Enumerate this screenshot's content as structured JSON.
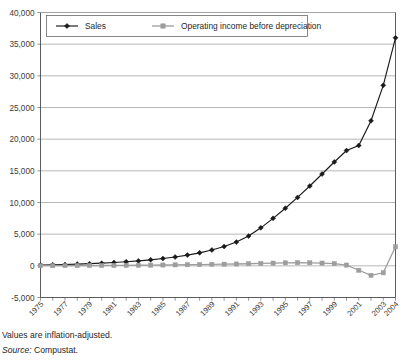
{
  "chart_data": {
    "type": "line",
    "title": "",
    "xlabel": "",
    "ylabel": "",
    "ylim": [
      -5000,
      40000
    ],
    "ytick_step": 5000,
    "ytick_labels": [
      "40,000",
      "35,000",
      "30,000",
      "25,000",
      "20,000",
      "15,000",
      "10,000",
      "5,000",
      "0",
      "-5,000"
    ],
    "ytick_values": [
      40000,
      35000,
      30000,
      25000,
      20000,
      15000,
      10000,
      5000,
      0,
      -5000
    ],
    "grid": true,
    "legend_position": "top-left-inside",
    "x": [
      1975,
      1976,
      1977,
      1978,
      1979,
      1980,
      1981,
      1982,
      1983,
      1984,
      1985,
      1986,
      1987,
      1988,
      1989,
      1990,
      1991,
      1992,
      1993,
      1994,
      1995,
      1996,
      1997,
      1998,
      1999,
      2000,
      2001,
      2002,
      2003,
      2004
    ],
    "xtick_labels": [
      "1975",
      "1977",
      "1979",
      "1981",
      "1983",
      "1985",
      "1987",
      "1989",
      "1991",
      "1993",
      "1995",
      "1997",
      "1999",
      "2001",
      "2003",
      "2004"
    ],
    "xtick_values": [
      1975,
      1977,
      1979,
      1981,
      1983,
      1985,
      1987,
      1989,
      1991,
      1993,
      1995,
      1997,
      1999,
      2001,
      2003,
      2004
    ],
    "series": [
      {
        "name": "Sales",
        "color": "#1a1a1a",
        "marker": "diamond",
        "values": [
          120,
          160,
          210,
          270,
          340,
          420,
          520,
          640,
          780,
          950,
          1150,
          1400,
          1700,
          2050,
          2500,
          3050,
          3750,
          4700,
          6000,
          7500,
          9100,
          10800,
          12600,
          14500,
          16400,
          18200,
          19000,
          22900,
          28500,
          36000
        ]
      },
      {
        "name": "Operating income before depreciation",
        "color": "#9d9d9d",
        "marker": "square",
        "values": [
          20,
          25,
          30,
          35,
          45,
          55,
          65,
          80,
          95,
          110,
          130,
          150,
          175,
          200,
          230,
          260,
          290,
          330,
          380,
          430,
          470,
          500,
          480,
          430,
          350,
          120,
          -700,
          -1500,
          -1100,
          3000
        ]
      }
    ]
  },
  "legend": {
    "items": [
      {
        "label": "Sales"
      },
      {
        "label": "Operating income before depreciation"
      }
    ]
  },
  "footnotes": {
    "values_note": "Values are inflation-adjusted.",
    "source_prefix": "Source:",
    "source_name": "Compustat."
  }
}
